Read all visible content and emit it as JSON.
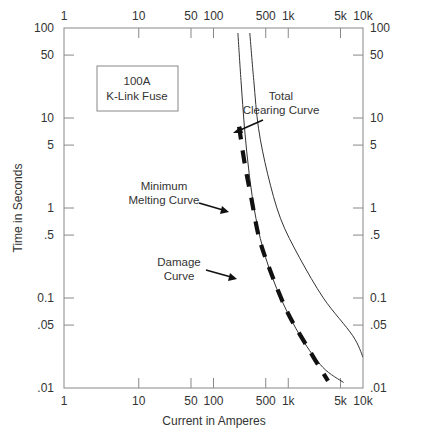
{
  "chart_data": {
    "type": "line",
    "title": "",
    "xlabel": "Current in Amperes",
    "ylabel": "Time in Seconds",
    "x_scale": "log",
    "y_scale": "log",
    "xlim": [
      1,
      10000
    ],
    "ylim": [
      0.01,
      100
    ],
    "grid": false,
    "x_ticks": [
      {
        "value": 1,
        "label": "1"
      },
      {
        "value": 10,
        "label": "10"
      },
      {
        "value": 50,
        "label": "50"
      },
      {
        "value": 100,
        "label": "100"
      },
      {
        "value": 500,
        "label": "500"
      },
      {
        "value": 1000,
        "label": "1k"
      },
      {
        "value": 5000,
        "label": "5k"
      },
      {
        "value": 10000,
        "label": "10k"
      }
    ],
    "y_ticks": [
      {
        "value": 100,
        "label": "100"
      },
      {
        "value": 50,
        "label": "50"
      },
      {
        "value": 10,
        "label": "10"
      },
      {
        "value": 5,
        "label": "5"
      },
      {
        "value": 1,
        "label": "1"
      },
      {
        "value": 0.5,
        "label": ".5"
      },
      {
        "value": 0.1,
        "label": "0.1"
      },
      {
        "value": 0.05,
        "label": ".05"
      },
      {
        "value": 0.01,
        "label": ".01"
      }
    ],
    "series": [
      {
        "name": "Minimum Melting Curve",
        "style": "thin-solid",
        "color": "#333333",
        "points": [
          [
            212,
            88
          ],
          [
            233,
            26
          ],
          [
            260,
            7.7
          ],
          [
            300,
            2.4
          ],
          [
            370,
            0.76
          ],
          [
            500,
            0.28
          ],
          [
            800,
            0.098
          ],
          [
            1500,
            0.036
          ],
          [
            2900,
            0.017
          ],
          [
            5500,
            0.0115
          ]
        ]
      },
      {
        "name": "Total Clearing Curve",
        "style": "thin-solid",
        "color": "#333333",
        "points": [
          [
            306,
            88
          ],
          [
            346,
            26
          ],
          [
            400,
            7.7
          ],
          [
            530,
            2.4
          ],
          [
            790,
            0.76
          ],
          [
            1420,
            0.28
          ],
          [
            3000,
            0.098
          ],
          [
            7300,
            0.038
          ],
          [
            10000,
            0.022
          ]
        ]
      },
      {
        "name": "Damage Curve",
        "style": "thick-dashed",
        "color": "#111111",
        "points": [
          [
            220,
            8.0
          ],
          [
            260,
            3.2
          ],
          [
            320,
            1.29
          ],
          [
            410,
            0.46
          ],
          [
            590,
            0.19
          ],
          [
            990,
            0.068
          ],
          [
            1830,
            0.028
          ],
          [
            3400,
            0.012
          ]
        ]
      }
    ],
    "annotations": [
      {
        "text": [
          "100A",
          "K-Link Fuse"
        ],
        "boxed": true
      },
      {
        "text": [
          "Total",
          "Clearing Curve"
        ],
        "arrow_to": "Total Clearing Curve"
      },
      {
        "text": [
          "Minimum",
          "Melting Curve"
        ],
        "arrow_to": "Minimum Melting Curve"
      },
      {
        "text": [
          "Damage",
          "Curve"
        ],
        "arrow_to": "Damage Curve"
      }
    ]
  },
  "labels": {
    "xlabel": "Current in Amperes",
    "ylabel": "Time in Seconds",
    "box_line1": "100A",
    "box_line2": "K-Link Fuse",
    "tc_line1": "Total",
    "tc_line2": "Clearing Curve",
    "mm_line1": "Minimum",
    "mm_line2": "Melting Curve",
    "dm_line1": "Damage",
    "dm_line2": "Curve"
  }
}
